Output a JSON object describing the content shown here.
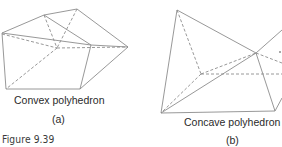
{
  "figure": {
    "caption": "Figure 9.39",
    "panels": [
      {
        "id": "a",
        "title": "Convex polyhedron",
        "sublabel": "(a)"
      },
      {
        "id": "b",
        "title": "Concave polyhedron",
        "sublabel": "(b)"
      }
    ],
    "line_color": "#8c8c8c",
    "text_color": "#2a2a2a"
  }
}
